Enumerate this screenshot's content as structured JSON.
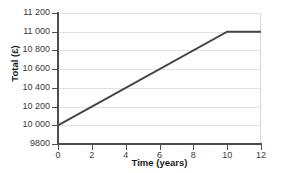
{
  "chart_data": {
    "type": "line",
    "title": "",
    "xlabel": "Time (years)",
    "ylabel": "Total (£)",
    "xlim": [
      0,
      12
    ],
    "ylim": [
      9800,
      11200
    ],
    "grid": true,
    "legend": "none",
    "x_ticks": [
      0,
      2,
      4,
      6,
      8,
      10,
      12
    ],
    "x_tick_labels": [
      "0",
      "2",
      "4",
      "6",
      "8",
      "10",
      "12"
    ],
    "y_ticks": [
      9800,
      10000,
      10200,
      10400,
      10600,
      10800,
      11000,
      11200
    ],
    "y_tick_labels": [
      "9800",
      "10 000",
      "10 200",
      "10 400",
      "10 600",
      "10 800",
      "11 000",
      "11 200"
    ],
    "series": [
      {
        "name": "Total",
        "color": "#454545",
        "x": [
          0,
          10,
          12
        ],
        "values": [
          10000,
          11000,
          11000
        ]
      }
    ],
    "points": [
      {
        "x": 0,
        "y": 10000
      },
      {
        "x": 2,
        "y": 10200
      },
      {
        "x": 4,
        "y": 10400
      },
      {
        "x": 6,
        "y": 10600
      },
      {
        "x": 8,
        "y": 10800
      },
      {
        "x": 10,
        "y": 11000
      },
      {
        "x": 12,
        "y": 11000
      }
    ]
  },
  "colors": {
    "background": "#ffffff",
    "line": "#454545",
    "axis": "#4d4d4d",
    "gridline": "#e2e2e2",
    "plot_border": "#d8d8d8",
    "tick_label": "#3a3a3a",
    "axis_title": "#1a1a1a"
  }
}
